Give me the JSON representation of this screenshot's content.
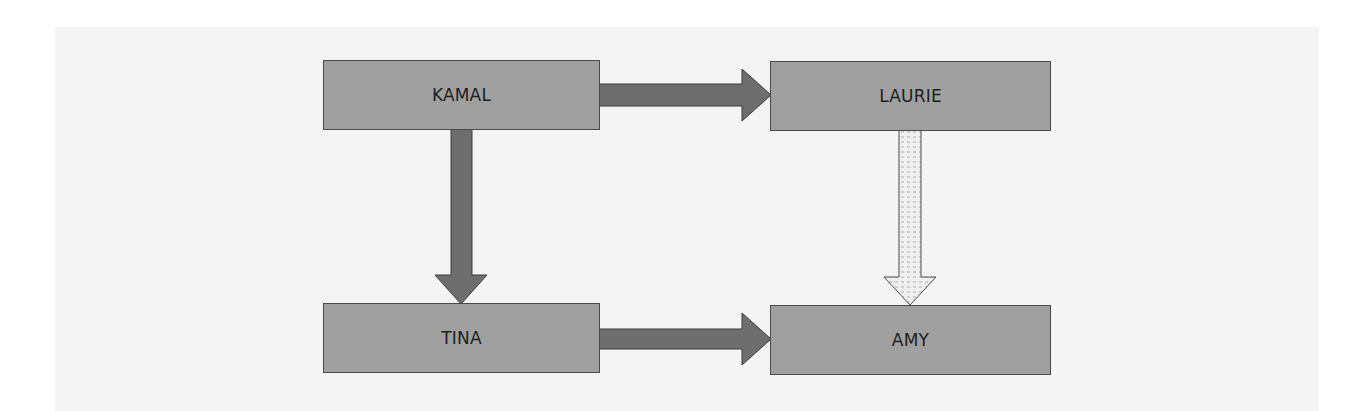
{
  "diagram": {
    "type": "flow",
    "nodes": [
      {
        "id": "kamal",
        "label": "KAMAL"
      },
      {
        "id": "laurie",
        "label": "LAURIE"
      },
      {
        "id": "tina",
        "label": "TINA"
      },
      {
        "id": "amy",
        "label": "AMY"
      }
    ],
    "edges": [
      {
        "from": "kamal",
        "to": "laurie",
        "style": "solid-dark"
      },
      {
        "from": "kamal",
        "to": "tina",
        "style": "solid-dark"
      },
      {
        "from": "laurie",
        "to": "amy",
        "style": "dotted-light"
      },
      {
        "from": "tina",
        "to": "amy",
        "style": "solid-dark"
      }
    ],
    "colors": {
      "node_fill": "#a0a0a0",
      "node_border": "#4a4a4a",
      "arrow_dark": "#6e6e6e",
      "arrow_light": "#eeeeee",
      "background": "#f4f4f4"
    }
  }
}
